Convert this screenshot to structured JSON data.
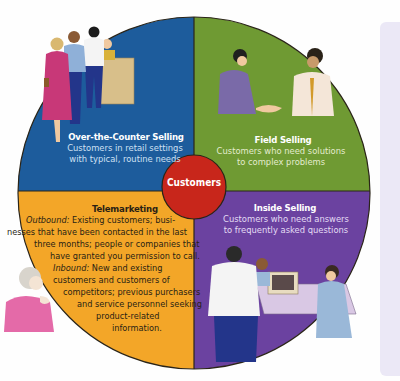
{
  "diagram": {
    "center": {
      "label": "Customers",
      "color": "#c8261b"
    },
    "quadrants": [
      {
        "id": "over-the-counter",
        "title": "Over-the-Counter Selling",
        "description_lines": [
          "Customers in retail settings",
          "with typical, routine needs"
        ],
        "color": "#1d5c9c",
        "illustration": "customers-queue-at-counter"
      },
      {
        "id": "field-selling",
        "title": "Field Selling",
        "description_lines": [
          "Customers who need solutions",
          "to complex problems"
        ],
        "color": "#6f9a33",
        "illustration": "two-men-handshake"
      },
      {
        "id": "inside-selling",
        "title": "Inside Selling",
        "description_lines": [
          "Customers who need answers",
          "to frequently asked questions"
        ],
        "color": "#6b42a0",
        "illustration": "office-computer-workers"
      },
      {
        "id": "telemarketing",
        "title": "Telemarketing",
        "color": "#f3a628",
        "illustration": "woman-with-headset",
        "outbound_label": "Outbound:",
        "inbound_label": "Inbound:",
        "lines": [
          " Existing customers; busi-",
          "nesses that have been contacted in the last",
          "three months; people or companies that",
          "have granted you permission to call.",
          " New and existing",
          "customers and customers of",
          "competitors; previous purchasers",
          "and service personnel seeking",
          "product-related",
          "information."
        ]
      }
    ]
  }
}
